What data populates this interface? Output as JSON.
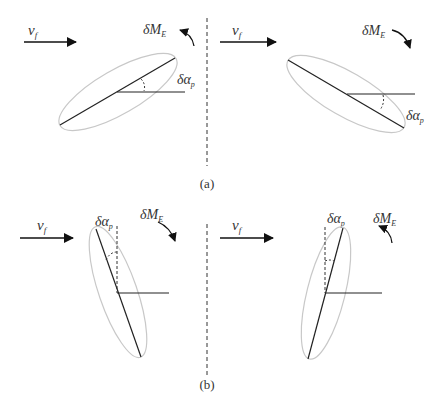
{
  "figure": {
    "panels": [
      {
        "id": "a",
        "caption": "(a)",
        "subfigures": [
          {
            "side": "left",
            "velocity_label": "v",
            "velocity_subscript": "f",
            "moment_label": "δM",
            "moment_subscript": "E",
            "moment_direction": "counterclockwise",
            "angle_label": "δα",
            "angle_subscript": "p",
            "body_orientation": "tilted up-right"
          },
          {
            "side": "right",
            "velocity_label": "v",
            "velocity_subscript": "f",
            "moment_label": "δM",
            "moment_subscript": "E",
            "moment_direction": "clockwise",
            "angle_label": "δα",
            "angle_subscript": "p",
            "body_orientation": "tilted down-right"
          }
        ]
      },
      {
        "id": "b",
        "caption": "(b)",
        "subfigures": [
          {
            "side": "left",
            "velocity_label": "v",
            "velocity_subscript": "f",
            "moment_label": "δM",
            "moment_subscript": "E",
            "moment_direction": "clockwise",
            "angle_label": "δα",
            "angle_subscript": "p",
            "body_orientation": "near-vertical, top leaning left"
          },
          {
            "side": "right",
            "velocity_label": "v",
            "velocity_subscript": "f",
            "moment_label": "δM",
            "moment_subscript": "E",
            "moment_direction": "counterclockwise",
            "angle_label": "δα",
            "angle_subscript": "p",
            "body_orientation": "near-vertical, top leaning right"
          }
        ]
      }
    ],
    "colors": {
      "line": "#222222",
      "ellipse": "#c8c8c8",
      "text": "#333333"
    }
  }
}
